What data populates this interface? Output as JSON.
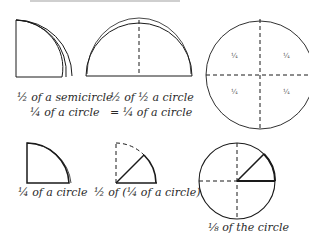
{
  "figure": {
    "top_row": {
      "folded_quarter": {
        "label_line1": "½ of a semicircle",
        "label_line2": "¼ of a circle"
      },
      "semicircle": {
        "label_line1": "½ of ½ a circle",
        "label_line2": "= ¼ of a circle"
      },
      "full_circle": {
        "quadrant_labels": [
          "¼",
          "¼",
          "¼",
          "¼"
        ]
      }
    },
    "bottom_row": {
      "quarter": {
        "label": "¼ of a circle"
      },
      "half_quarter": {
        "label": "½ of (¼ of a circle)"
      },
      "eighth_circle": {
        "label": "⅛ of the circle"
      }
    },
    "colors": {
      "stroke": "#1a1a1a",
      "background": "#ffffff"
    }
  }
}
